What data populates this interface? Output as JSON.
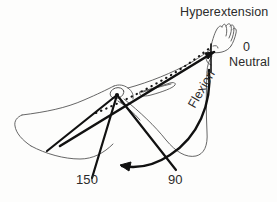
{
  "figure": {
    "background_color": "#fdfdfc",
    "ink_color": "#1a1a1a",
    "outline_color": "#4a4a4a",
    "labels": {
      "hyperextension": "Hyperextension",
      "zero": "0",
      "neutral": "Neutral",
      "flexion": "Flexion",
      "deg150": "150",
      "deg90": "90"
    },
    "measurements": [
      {
        "name": "neutral",
        "value": "0",
        "unit": "degrees"
      },
      {
        "name": "flexion-mid",
        "value": "90",
        "unit": "degrees"
      },
      {
        "name": "flexion-max",
        "value": "150",
        "unit": "degrees"
      }
    ],
    "parts": [
      "thigh-outline",
      "calf-outline",
      "foot-outline",
      "patella",
      "knee-pivot",
      "neutral-axis-line",
      "hyperextension-dotted-line",
      "flexion-arc",
      "flexion-90-line",
      "flexion-150-line"
    ]
  }
}
